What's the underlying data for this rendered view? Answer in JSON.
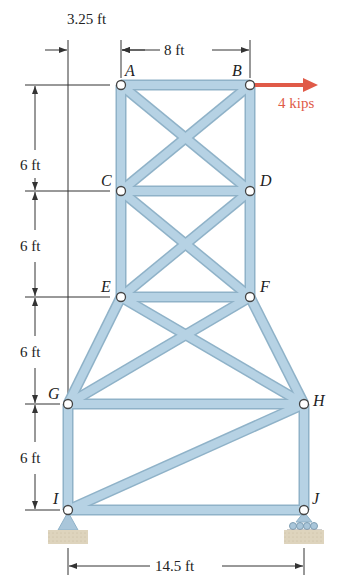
{
  "diagram": {
    "type": "truss",
    "nodes": [
      {
        "id": "A",
        "label": "A",
        "x": 121,
        "y": 85
      },
      {
        "id": "B",
        "label": "B",
        "x": 250,
        "y": 85
      },
      {
        "id": "C",
        "label": "C",
        "x": 121,
        "y": 191
      },
      {
        "id": "D",
        "label": "D",
        "x": 250,
        "y": 191
      },
      {
        "id": "E",
        "label": "E",
        "x": 121,
        "y": 297
      },
      {
        "id": "F",
        "label": "F",
        "x": 250,
        "y": 297
      },
      {
        "id": "G",
        "label": "G",
        "x": 68,
        "y": 404
      },
      {
        "id": "H",
        "label": "H",
        "x": 304,
        "y": 404
      },
      {
        "id": "I",
        "label": "I",
        "x": 68,
        "y": 510
      },
      {
        "id": "J",
        "label": "J",
        "x": 304,
        "y": 510
      }
    ],
    "members": [
      [
        "A",
        "B"
      ],
      [
        "A",
        "C"
      ],
      [
        "B",
        "D"
      ],
      [
        "A",
        "D"
      ],
      [
        "B",
        "C"
      ],
      [
        "C",
        "D"
      ],
      [
        "C",
        "E"
      ],
      [
        "D",
        "F"
      ],
      [
        "C",
        "F"
      ],
      [
        "D",
        "E"
      ],
      [
        "E",
        "F"
      ],
      [
        "E",
        "G"
      ],
      [
        "F",
        "H"
      ],
      [
        "E",
        "H"
      ],
      [
        "F",
        "G"
      ],
      [
        "G",
        "H"
      ],
      [
        "G",
        "I"
      ],
      [
        "H",
        "J"
      ],
      [
        "I",
        "H"
      ],
      [
        "I",
        "J"
      ]
    ],
    "load": {
      "node": "B",
      "label": "4 kips",
      "direction": "right",
      "color": "#e05a48"
    },
    "supports": [
      {
        "node": "I",
        "type": "pin"
      },
      {
        "node": "J",
        "type": "roller"
      }
    ],
    "dimensions": {
      "top_offset": "3.25 ft",
      "top_width": "8 ft",
      "heights": [
        "6 ft",
        "6 ft",
        "6 ft",
        "6 ft"
      ],
      "base_width": "14.5 ft"
    },
    "colors": {
      "member_fill": "#b6d2e4",
      "member_edge": "#8fb2c8",
      "load_arrow": "#e05a48",
      "ground": "#d9cfb8"
    }
  }
}
